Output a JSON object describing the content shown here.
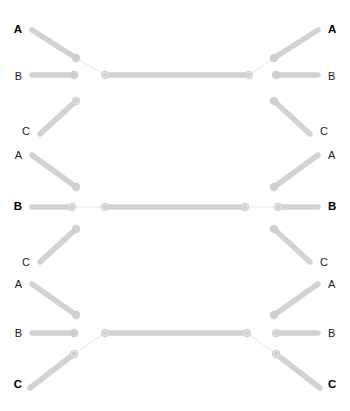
{
  "figure": {
    "title": "",
    "type": "mirrored-tree-diagram",
    "width": 350,
    "height": 411,
    "background_color": "#ffffff"
  },
  "style": {
    "branch_color": "#d2d2d2",
    "branch_color_light": "#d8d8d8",
    "node_color": "#cfcfcf",
    "connector_color": "#e2e2e2",
    "label_color": "#1a1a1a",
    "label_color_bold": "#000000",
    "branch_width": 5.5,
    "connector_width": 0.8,
    "node_radius": 4.2
  },
  "labels": {
    "left": [
      {
        "id": "L-A1",
        "text": "A",
        "bold": true,
        "x": 22,
        "y": 30
      },
      {
        "id": "L-B1",
        "text": "B",
        "bold": false,
        "x": 22,
        "y": 76
      },
      {
        "id": "L-C1",
        "text": "C",
        "bold": false,
        "x": 30,
        "y": 131
      },
      {
        "id": "L-A2",
        "text": "A",
        "bold": false,
        "x": 22,
        "y": 155
      },
      {
        "id": "L-B2",
        "text": "B",
        "bold": true,
        "x": 22,
        "y": 207
      },
      {
        "id": "L-C2",
        "text": "C",
        "bold": false,
        "x": 30,
        "y": 262
      },
      {
        "id": "L-A3",
        "text": "A",
        "bold": false,
        "x": 22,
        "y": 284
      },
      {
        "id": "L-B3",
        "text": "B",
        "bold": false,
        "x": 22,
        "y": 333
      },
      {
        "id": "L-C3",
        "text": "C",
        "bold": true,
        "x": 22,
        "y": 385
      }
    ],
    "right": [
      {
        "id": "R-A1",
        "text": "A",
        "bold": true,
        "x": 328,
        "y": 30
      },
      {
        "id": "R-B1",
        "text": "B",
        "bold": false,
        "x": 328,
        "y": 76
      },
      {
        "id": "R-C1",
        "text": "C",
        "bold": false,
        "x": 320,
        "y": 131
      },
      {
        "id": "R-A2",
        "text": "A",
        "bold": false,
        "x": 328,
        "y": 155
      },
      {
        "id": "R-B2",
        "text": "B",
        "bold": true,
        "x": 328,
        "y": 207
      },
      {
        "id": "R-C2",
        "text": "C",
        "bold": false,
        "x": 320,
        "y": 262
      },
      {
        "id": "R-A3",
        "text": "A",
        "bold": false,
        "x": 328,
        "y": 284
      },
      {
        "id": "R-B3",
        "text": "B",
        "bold": false,
        "x": 328,
        "y": 333
      },
      {
        "id": "R-C3",
        "text": "C",
        "bold": true,
        "x": 328,
        "y": 385
      }
    ]
  },
  "branches": {
    "group_top": [
      {
        "id": "br-L-A1",
        "x1": 32,
        "y1": 30,
        "x2": 76,
        "y2": 58
      },
      {
        "id": "br-L-B1",
        "x1": 32,
        "y1": 75,
        "x2": 74,
        "y2": 75
      },
      {
        "id": "br-L-C1",
        "x1": 40,
        "y1": 134,
        "x2": 76,
        "y2": 101
      },
      {
        "id": "br-L-A2",
        "x1": 32,
        "y1": 155,
        "x2": 76,
        "y2": 187
      },
      {
        "id": "br-R-A1",
        "x1": 318,
        "y1": 30,
        "x2": 274,
        "y2": 58
      },
      {
        "id": "br-R-B1",
        "x1": 318,
        "y1": 75,
        "x2": 276,
        "y2": 75
      },
      {
        "id": "br-R-C1",
        "x1": 310,
        "y1": 134,
        "x2": 274,
        "y2": 101
      },
      {
        "id": "br-R-A2",
        "x1": 318,
        "y1": 155,
        "x2": 274,
        "y2": 187
      }
    ],
    "group_middle": [
      {
        "id": "br-L-B2",
        "x1": 32,
        "y1": 207,
        "x2": 72,
        "y2": 207
      },
      {
        "id": "br-L-C2",
        "x1": 40,
        "y1": 262,
        "x2": 76,
        "y2": 229
      },
      {
        "id": "br-L-A3",
        "x1": 32,
        "y1": 284,
        "x2": 76,
        "y2": 315
      },
      {
        "id": "br-R-B2",
        "x1": 318,
        "y1": 207,
        "x2": 278,
        "y2": 207
      },
      {
        "id": "br-R-C2",
        "x1": 310,
        "y1": 262,
        "x2": 274,
        "y2": 229
      },
      {
        "id": "br-R-A3",
        "x1": 318,
        "y1": 284,
        "x2": 274,
        "y2": 315
      }
    ],
    "group_bottom": [
      {
        "id": "br-L-B3",
        "x1": 32,
        "y1": 333,
        "x2": 74,
        "y2": 333
      },
      {
        "id": "br-L-C3",
        "x1": 30,
        "y1": 388,
        "x2": 74,
        "y2": 354
      },
      {
        "id": "br-R-B3",
        "x1": 318,
        "y1": 333,
        "x2": 276,
        "y2": 333
      },
      {
        "id": "br-R-C3",
        "x1": 320,
        "y1": 388,
        "x2": 276,
        "y2": 354
      }
    ]
  },
  "trunks": [
    {
      "id": "trunk-top",
      "x1": 105,
      "y1": 75,
      "x2": 249,
      "y2": 75
    },
    {
      "id": "trunk-middle",
      "x1": 105,
      "y1": 207,
      "x2": 245,
      "y2": 207
    },
    {
      "id": "trunk-bottom",
      "x1": 105,
      "y1": 333,
      "x2": 247,
      "y2": 333
    }
  ],
  "connectors": [
    {
      "id": "cn-top-left",
      "x1": 76,
      "y1": 58,
      "x2": 105,
      "y2": 75
    },
    {
      "id": "cn-top-right",
      "x1": 274,
      "y1": 58,
      "x2": 249,
      "y2": 75
    },
    {
      "id": "cn-mid-left",
      "x1": 72,
      "y1": 207,
      "x2": 105,
      "y2": 207
    },
    {
      "id": "cn-mid-right",
      "x1": 278,
      "y1": 207,
      "x2": 245,
      "y2": 207
    },
    {
      "id": "cn-bottom-left",
      "x1": 74,
      "y1": 354,
      "x2": 105,
      "y2": 333
    },
    {
      "id": "cn-bottom-right",
      "x1": 276,
      "y1": 354,
      "x2": 247,
      "y2": 333
    }
  ],
  "nodes": [
    {
      "id": "nd-L-A1",
      "x": 76,
      "y": 58,
      "ring": false
    },
    {
      "id": "nd-L-B1",
      "x": 74,
      "y": 75,
      "ring": false
    },
    {
      "id": "nd-L-C1",
      "x": 76,
      "y": 101,
      "ring": true
    },
    {
      "id": "nd-L-A2",
      "x": 76,
      "y": 187,
      "ring": false
    },
    {
      "id": "nd-J-TL",
      "x": 105,
      "y": 75,
      "ring": true
    },
    {
      "id": "nd-J-TR",
      "x": 249,
      "y": 75,
      "ring": true
    },
    {
      "id": "nd-R-A1",
      "x": 274,
      "y": 58,
      "ring": false
    },
    {
      "id": "nd-R-B1",
      "x": 276,
      "y": 75,
      "ring": false
    },
    {
      "id": "nd-R-C1",
      "x": 274,
      "y": 101,
      "ring": false
    },
    {
      "id": "nd-R-A2",
      "x": 274,
      "y": 187,
      "ring": false
    },
    {
      "id": "nd-L-B2",
      "x": 72,
      "y": 207,
      "ring": true
    },
    {
      "id": "nd-J-ML",
      "x": 105,
      "y": 207,
      "ring": true
    },
    {
      "id": "nd-J-MR",
      "x": 245,
      "y": 207,
      "ring": true
    },
    {
      "id": "nd-R-B2",
      "x": 278,
      "y": 207,
      "ring": true
    },
    {
      "id": "nd-L-C2",
      "x": 76,
      "y": 229,
      "ring": false
    },
    {
      "id": "nd-L-A3",
      "x": 76,
      "y": 315,
      "ring": false
    },
    {
      "id": "nd-R-C2",
      "x": 274,
      "y": 229,
      "ring": false
    },
    {
      "id": "nd-R-A3",
      "x": 274,
      "y": 315,
      "ring": false
    },
    {
      "id": "nd-L-B3",
      "x": 74,
      "y": 333,
      "ring": false
    },
    {
      "id": "nd-J-BL",
      "x": 105,
      "y": 333,
      "ring": true
    },
    {
      "id": "nd-J-BR",
      "x": 247,
      "y": 333,
      "ring": true
    },
    {
      "id": "nd-L-C3",
      "x": 74,
      "y": 354,
      "ring": true
    },
    {
      "id": "nd-R-B3",
      "x": 276,
      "y": 333,
      "ring": true
    },
    {
      "id": "nd-R-C3",
      "x": 276,
      "y": 354,
      "ring": true
    }
  ],
  "chart_data": {
    "type": "diagram",
    "title": "",
    "tip_labels_left": [
      "A",
      "B",
      "C",
      "A",
      "B",
      "C",
      "A",
      "B",
      "C"
    ],
    "tip_labels_right": [
      "A",
      "B",
      "C",
      "A",
      "B",
      "C",
      "A",
      "B",
      "C"
    ],
    "bold_tips": [
      "A",
      "B",
      "C"
    ],
    "connected_rows": 3,
    "dangling_branch_pairs": 6,
    "legend": []
  }
}
